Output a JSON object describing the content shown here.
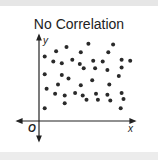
{
  "chart_data": {
    "type": "scatter",
    "title": "No Correlation",
    "xlabel": "x",
    "ylabel": "y",
    "origin_label": "O",
    "grid": false,
    "xlim": [
      0,
      10
    ],
    "ylim": [
      0,
      10
    ],
    "points": [
      [
        0.6,
        7.6
      ],
      [
        1.8,
        8.2
      ],
      [
        2.9,
        8.7
      ],
      [
        5.2,
        9.1
      ],
      [
        7.8,
        9.0
      ],
      [
        4.4,
        8.1
      ],
      [
        7.3,
        8.1
      ],
      [
        1.5,
        7.0
      ],
      [
        2.4,
        6.8
      ],
      [
        3.5,
        7.2
      ],
      [
        4.3,
        6.7
      ],
      [
        4.7,
        6.2
      ],
      [
        5.7,
        7.1
      ],
      [
        6.7,
        7.0
      ],
      [
        8.7,
        7.2
      ],
      [
        9.6,
        7.1
      ],
      [
        0.6,
        5.5
      ],
      [
        2.4,
        5.4
      ],
      [
        5.9,
        6.2
      ],
      [
        7.2,
        6.0
      ],
      [
        8.7,
        6.3
      ],
      [
        8.4,
        5.3
      ],
      [
        3.1,
        5.0
      ],
      [
        5.6,
        4.8
      ],
      [
        2.0,
        4.3
      ],
      [
        4.4,
        4.2
      ],
      [
        7.4,
        4.3
      ],
      [
        0.8,
        3.8
      ],
      [
        1.7,
        3.2
      ],
      [
        2.7,
        3.0
      ],
      [
        3.8,
        3.3
      ],
      [
        4.6,
        3.0
      ],
      [
        5.0,
        2.5
      ],
      [
        6.0,
        3.2
      ],
      [
        6.2,
        2.5
      ],
      [
        7.2,
        3.1
      ],
      [
        7.5,
        2.4
      ],
      [
        8.7,
        3.3
      ],
      [
        8.9,
        2.6
      ],
      [
        2.7,
        2.1
      ],
      [
        0.6,
        1.5
      ],
      [
        8.6,
        1.5
      ]
    ]
  },
  "colors": {
    "dot": "#2a2a2a",
    "axis": "#222222"
  }
}
